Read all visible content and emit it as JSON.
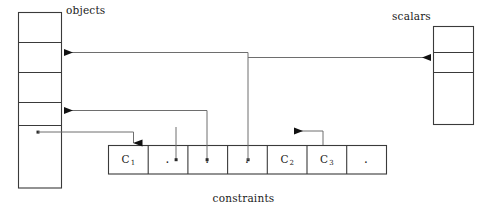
{
  "figure": {
    "type": "diagram",
    "background": "#ffffff",
    "stroke_color": "#3a3a3a",
    "text_color": "#1a1a1a"
  },
  "labels": {
    "objects": "objects",
    "scalars": "scalars",
    "constraints": "constraints"
  },
  "tables": {
    "objects": {
      "name": "objects",
      "x": 18,
      "y": 12,
      "width": 44,
      "height": 176,
      "row_dividers_y": [
        42,
        72,
        102,
        125
      ],
      "cells": [
        "",
        "",
        "",
        "",
        ""
      ]
    },
    "scalars": {
      "name": "scalars",
      "x": 433,
      "y": 26,
      "width": 41,
      "height": 99,
      "row_dividers_y": [
        52,
        72
      ],
      "cells": [
        "",
        "",
        ""
      ]
    },
    "constraints": {
      "name": "constraints",
      "x": 108,
      "y": 145,
      "width": 278,
      "height": 29,
      "cell_width": 39.7,
      "cells": [
        {
          "label": "C",
          "subscript": "1",
          "kind": "name"
        },
        {
          "label": "·",
          "subscript": "",
          "kind": "dot"
        },
        {
          "label": "·",
          "subscript": "",
          "kind": "dot"
        },
        {
          "label": "·",
          "subscript": "",
          "kind": "dot"
        },
        {
          "label": "C",
          "subscript": "2",
          "kind": "name"
        },
        {
          "label": "C",
          "subscript": "3",
          "kind": "name"
        },
        {
          "label": "·",
          "subscript": "",
          "kind": "dot"
        }
      ]
    }
  },
  "connectors": [
    {
      "name": "constraints-cell4-to-objects-row2",
      "from": "constraints cell 4 (dot)",
      "to": "objects row 2",
      "arrow_at": "objects",
      "direction": "left"
    },
    {
      "name": "constraints-cell4-to-scalars-row2",
      "from": "constraints cell 4 (dot)",
      "to": "scalars row 2",
      "arrow_at": "scalars",
      "direction": "right"
    },
    {
      "name": "constraints-cell3-to-objects-row4",
      "from": "constraints cell 3 (dot)",
      "to": "objects row 4",
      "arrow_at": "objects",
      "direction": "left"
    },
    {
      "name": "objects-row5-to-constraints-cell1",
      "from": "objects row 5 (dot)",
      "to": "constraints cell C1",
      "arrow_at": "constraints",
      "direction": "down"
    },
    {
      "name": "constraints-cell6-loop-to-cell2",
      "from": "constraints cell C3",
      "to": "left of C3",
      "arrow_at": "left",
      "direction": "left"
    }
  ]
}
